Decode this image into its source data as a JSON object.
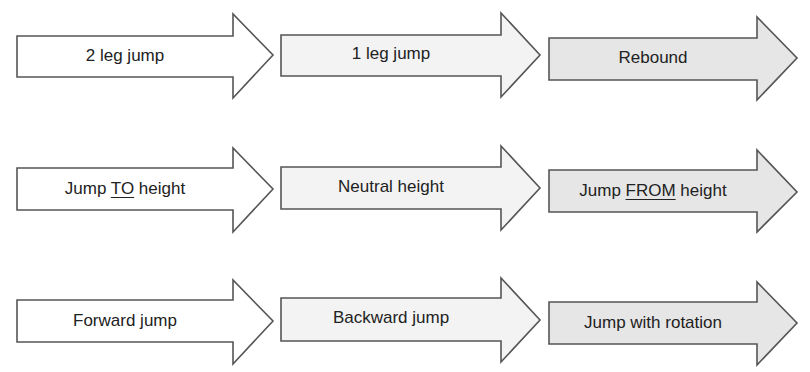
{
  "diagram": {
    "colors": {
      "stroke": "#555555",
      "text": "#222222",
      "fill_col1": "#ffffff",
      "fill_col2": "#f3f3f3",
      "fill_col3": "#e6e6e6"
    },
    "rows": [
      {
        "arrows": [
          {
            "pre": "2 leg jump",
            "ul": "",
            "post": ""
          },
          {
            "pre": "1 leg jump",
            "ul": "",
            "post": ""
          },
          {
            "pre": "Rebound",
            "ul": "",
            "post": ""
          }
        ]
      },
      {
        "arrows": [
          {
            "pre": "Jump ",
            "ul": "TO",
            "post": " height"
          },
          {
            "pre": "Neutral height",
            "ul": "",
            "post": ""
          },
          {
            "pre": "Jump ",
            "ul": "FROM",
            "post": " height"
          }
        ]
      },
      {
        "arrows": [
          {
            "pre": "Forward jump",
            "ul": "",
            "post": ""
          },
          {
            "pre": "Backward jump",
            "ul": "",
            "post": ""
          },
          {
            "pre": "Jump with rotation",
            "ul": "",
            "post": ""
          }
        ]
      }
    ]
  }
}
